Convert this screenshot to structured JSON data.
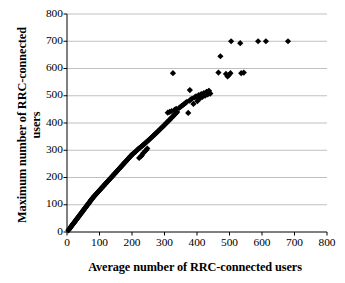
{
  "chart_data": {
    "type": "scatter",
    "title": "",
    "xlabel": "Average number of RRC-connected users",
    "ylabel_line1": "Maximum number of RRC-connected",
    "ylabel_line2": "users",
    "xlim": [
      0,
      800
    ],
    "ylim": [
      0,
      800
    ],
    "xticks": [
      0,
      100,
      200,
      300,
      400,
      500,
      600,
      700,
      800
    ],
    "yticks": [
      0,
      100,
      200,
      300,
      400,
      500,
      600,
      700,
      800
    ],
    "xtick_labels": [
      "0",
      "100",
      "200",
      "300",
      "400",
      "500",
      "600",
      "700",
      "800"
    ],
    "ytick_labels": [
      "0",
      "100",
      "200",
      "300",
      "400",
      "500",
      "600",
      "700",
      "800"
    ],
    "grid": "horizontal",
    "grid_color": "#b0b0b0",
    "axis_color": "#000000",
    "marker": "diamond",
    "marker_color": "#000000",
    "marker_size": 5,
    "legend": null,
    "series": [
      {
        "name": "cells",
        "points": [
          [
            4,
            6
          ],
          [
            6,
            9
          ],
          [
            8,
            12
          ],
          [
            9,
            14
          ],
          [
            11,
            17
          ],
          [
            12,
            19
          ],
          [
            14,
            22
          ],
          [
            15,
            24
          ],
          [
            17,
            27
          ],
          [
            18,
            29
          ],
          [
            20,
            31
          ],
          [
            21,
            33
          ],
          [
            23,
            36
          ],
          [
            24,
            38
          ],
          [
            26,
            41
          ],
          [
            27,
            43
          ],
          [
            29,
            46
          ],
          [
            30,
            48
          ],
          [
            32,
            50
          ],
          [
            33,
            52
          ],
          [
            35,
            55
          ],
          [
            36,
            57
          ],
          [
            38,
            60
          ],
          [
            39,
            62
          ],
          [
            41,
            64
          ],
          [
            42,
            67
          ],
          [
            44,
            69
          ],
          [
            45,
            71
          ],
          [
            47,
            74
          ],
          [
            48,
            76
          ],
          [
            50,
            79
          ],
          [
            51,
            81
          ],
          [
            53,
            83
          ],
          [
            54,
            86
          ],
          [
            56,
            88
          ],
          [
            57,
            90
          ],
          [
            59,
            93
          ],
          [
            60,
            95
          ],
          [
            62,
            98
          ],
          [
            63,
            100
          ],
          [
            65,
            102
          ],
          [
            66,
            105
          ],
          [
            68,
            107
          ],
          [
            69,
            109
          ],
          [
            71,
            112
          ],
          [
            72,
            114
          ],
          [
            74,
            117
          ],
          [
            75,
            119
          ],
          [
            77,
            121
          ],
          [
            78,
            124
          ],
          [
            80,
            126
          ],
          [
            82,
            129
          ],
          [
            84,
            132
          ],
          [
            86,
            134
          ],
          [
            88,
            137
          ],
          [
            90,
            140
          ],
          [
            92,
            142
          ],
          [
            94,
            145
          ],
          [
            96,
            148
          ],
          [
            98,
            150
          ],
          [
            100,
            153
          ],
          [
            102,
            156
          ],
          [
            104,
            158
          ],
          [
            106,
            161
          ],
          [
            108,
            163
          ],
          [
            110,
            166
          ],
          [
            112,
            169
          ],
          [
            114,
            171
          ],
          [
            116,
            174
          ],
          [
            118,
            176
          ],
          [
            120,
            179
          ],
          [
            122,
            182
          ],
          [
            124,
            184
          ],
          [
            126,
            187
          ],
          [
            128,
            190
          ],
          [
            130,
            192
          ],
          [
            132,
            195
          ],
          [
            134,
            197
          ],
          [
            136,
            200
          ],
          [
            138,
            203
          ],
          [
            140,
            205
          ],
          [
            142,
            208
          ],
          [
            144,
            211
          ],
          [
            146,
            213
          ],
          [
            148,
            216
          ],
          [
            150,
            218
          ],
          [
            152,
            221
          ],
          [
            154,
            224
          ],
          [
            156,
            226
          ],
          [
            158,
            229
          ],
          [
            160,
            232
          ],
          [
            162,
            234
          ],
          [
            164,
            237
          ],
          [
            166,
            239
          ],
          [
            168,
            242
          ],
          [
            170,
            245
          ],
          [
            172,
            247
          ],
          [
            174,
            250
          ],
          [
            176,
            253
          ],
          [
            178,
            255
          ],
          [
            180,
            258
          ],
          [
            182,
            260
          ],
          [
            184,
            263
          ],
          [
            186,
            266
          ],
          [
            188,
            268
          ],
          [
            190,
            271
          ],
          [
            192,
            274
          ],
          [
            194,
            276
          ],
          [
            196,
            279
          ],
          [
            198,
            281
          ],
          [
            200,
            284
          ],
          [
            203,
            287
          ],
          [
            206,
            290
          ],
          [
            209,
            293
          ],
          [
            212,
            296
          ],
          [
            215,
            300
          ],
          [
            218,
            303
          ],
          [
            221,
            306
          ],
          [
            224,
            309
          ],
          [
            222,
            272
          ],
          [
            228,
            278
          ],
          [
            231,
            283
          ],
          [
            234,
            289
          ],
          [
            227,
            312
          ],
          [
            230,
            315
          ],
          [
            233,
            318
          ],
          [
            236,
            321
          ],
          [
            239,
            324
          ],
          [
            242,
            327
          ],
          [
            245,
            331
          ],
          [
            248,
            334
          ],
          [
            240,
            296
          ],
          [
            244,
            301
          ],
          [
            247,
            306
          ],
          [
            251,
            337
          ],
          [
            254,
            340
          ],
          [
            257,
            344
          ],
          [
            260,
            347
          ],
          [
            263,
            350
          ],
          [
            266,
            354
          ],
          [
            269,
            357
          ],
          [
            272,
            360
          ],
          [
            275,
            364
          ],
          [
            278,
            367
          ],
          [
            281,
            371
          ],
          [
            284,
            374
          ],
          [
            287,
            378
          ],
          [
            290,
            381
          ],
          [
            293,
            385
          ],
          [
            296,
            388
          ],
          [
            299,
            392
          ],
          [
            302,
            395
          ],
          [
            305,
            399
          ],
          [
            308,
            403
          ],
          [
            311,
            406
          ],
          [
            314,
            410
          ],
          [
            317,
            413
          ],
          [
            320,
            417
          ],
          [
            323,
            421
          ],
          [
            326,
            424
          ],
          [
            329,
            428
          ],
          [
            332,
            432
          ],
          [
            335,
            436
          ],
          [
            310,
            438
          ],
          [
            316,
            441
          ],
          [
            322,
            444
          ],
          [
            331,
            448
          ],
          [
            336,
            452
          ],
          [
            339,
            440
          ],
          [
            345,
            455
          ],
          [
            349,
            459
          ],
          [
            353,
            463
          ],
          [
            357,
            466
          ],
          [
            361,
            470
          ],
          [
            365,
            474
          ],
          [
            369,
            478
          ],
          [
            373,
            437
          ],
          [
            377,
            482
          ],
          [
            381,
            486
          ],
          [
            385,
            490
          ],
          [
            389,
            470
          ],
          [
            393,
            494
          ],
          [
            397,
            498
          ],
          [
            401,
            480
          ],
          [
            405,
            502
          ],
          [
            409,
            490
          ],
          [
            413,
            506
          ],
          [
            417,
            496
          ],
          [
            421,
            510
          ],
          [
            425,
            500
          ],
          [
            429,
            514
          ],
          [
            433,
            505
          ],
          [
            437,
            518
          ],
          [
            441,
            508
          ],
          [
            326,
            583
          ],
          [
            378,
            521
          ],
          [
            430,
            512
          ],
          [
            435,
            516
          ],
          [
            438,
            510
          ],
          [
            466,
            585
          ],
          [
            489,
            580
          ],
          [
            494,
            571
          ],
          [
            498,
            576
          ],
          [
            503,
            583
          ],
          [
            536,
            583
          ],
          [
            544,
            585
          ],
          [
            472,
            645
          ],
          [
            505,
            700
          ],
          [
            533,
            693
          ],
          [
            588,
            700
          ],
          [
            612,
            700
          ],
          [
            680,
            700
          ]
        ]
      }
    ]
  },
  "figure": {
    "background": "#ffffff",
    "plot_left": 67,
    "plot_right": 327,
    "plot_top": 14,
    "plot_bottom": 232
  }
}
